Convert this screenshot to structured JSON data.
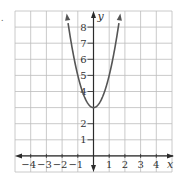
{
  "problem_marker": ".",
  "chart_data": {
    "type": "line",
    "title": "",
    "function": "y = 2x^2 + 3",
    "xlabel": "x",
    "ylabel": "y",
    "xlim": [
      -5,
      5
    ],
    "ylim": [
      -1,
      9
    ],
    "grid": true,
    "x_ticks": [
      -4,
      -3,
      -2,
      -1,
      1,
      2,
      3,
      4
    ],
    "x_tick_labels": [
      "−4",
      "−3",
      "−2",
      "−1",
      "1",
      "2",
      "3",
      "4"
    ],
    "y_ticks": [
      1,
      2,
      4,
      5,
      6,
      7,
      8
    ],
    "y_tick_labels": [
      "1",
      "2",
      "4",
      "5",
      "6",
      "7",
      "8"
    ],
    "vertex": [
      0,
      3
    ],
    "series": [
      {
        "name": "parabola",
        "x": [
          -1.7,
          -1.5,
          -1.25,
          -1,
          -0.75,
          -0.5,
          -0.25,
          0,
          0.25,
          0.5,
          0.75,
          1,
          1.25,
          1.5,
          1.7
        ],
        "y": [
          8.78,
          7.5,
          6.125,
          5,
          4.125,
          3.5,
          3.125,
          3,
          3.125,
          3.5,
          4.125,
          5,
          6.125,
          7.5,
          8.78
        ]
      }
    ],
    "arrows": "both ends of curve and both axes",
    "colors": {
      "grid": "#bdbdbd",
      "axes": "#2b2b2b",
      "curve": "#555555"
    }
  }
}
